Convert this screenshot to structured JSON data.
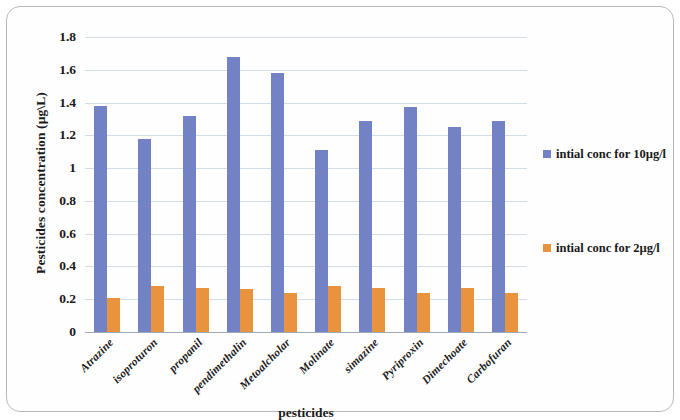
{
  "chart_data": {
    "type": "bar",
    "title": "",
    "xlabel": "pesticides",
    "ylabel": "Pesticides concentration (µg\\L)",
    "categories": [
      "Atrazine",
      "isoproturon",
      "propanil",
      "pendimethalin",
      "Metoalcholar",
      "Molinate",
      "simazine",
      "Pyriproxin",
      "Dimechoate",
      "Carbofuran"
    ],
    "series": [
      {
        "name": "intial conc for 10µg/l",
        "color": "#7282c4",
        "values": [
          1.38,
          1.18,
          1.32,
          1.68,
          1.58,
          1.11,
          1.29,
          1.37,
          1.25,
          1.29
        ]
      },
      {
        "name": "intial conc for 2µg/l",
        "color": "#e8943e",
        "values": [
          0.21,
          0.28,
          0.27,
          0.26,
          0.24,
          0.28,
          0.27,
          0.24,
          0.27,
          0.24
        ]
      }
    ],
    "ylim": [
      0,
      1.8
    ],
    "ytick_labels": [
      "1.8",
      "1.6",
      "1.4",
      "1.2",
      "1",
      "0.8",
      "0.6",
      "0.4",
      "0.2",
      "0"
    ],
    "ytick_values": [
      1.8,
      1.6,
      1.4,
      1.2,
      1.0,
      0.8,
      0.6,
      0.4,
      0.2,
      0
    ],
    "grid": true,
    "legend_position": "right"
  },
  "legend": {
    "items": [
      {
        "label": "intial conc for 10µg/l"
      },
      {
        "label": "intial conc for 2µg/l"
      }
    ]
  }
}
